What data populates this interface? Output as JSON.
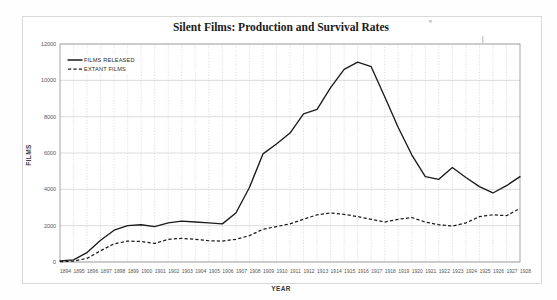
{
  "figure": {
    "title": "Silent Films: Production and Survival Rates"
  },
  "legend": {
    "items": [
      {
        "label": "FILMS RELEASED",
        "style": "solid"
      },
      {
        "label": "EXTANT FILMS",
        "style": "dashed"
      }
    ]
  },
  "axes": {
    "x_title": "YEAR",
    "y_title": "FILMS",
    "y_ticks": [
      "0",
      "2000",
      "4000",
      "6000",
      "8000",
      "10000",
      "12000"
    ],
    "x_ticks": [
      "1894",
      "1895",
      "1896",
      "1897",
      "1898",
      "1899",
      "1900",
      "1901",
      "1902",
      "1903",
      "1904",
      "1905",
      "1906",
      "1907",
      "1908",
      "1909",
      "1910",
      "1911",
      "1912",
      "1913",
      "1914",
      "1915",
      "1916",
      "1917",
      "1918",
      "1919",
      "1920",
      "1921",
      "1922",
      "1923",
      "1924",
      "1925",
      "1926",
      "1927",
      "1928"
    ]
  },
  "chart_data": {
    "type": "line",
    "title": "Silent Films: Production and Survival Rates",
    "xlabel": "YEAR",
    "ylabel": "FILMS",
    "xlim": [
      1894,
      1928
    ],
    "ylim": [
      0,
      12000
    ],
    "grid": true,
    "legend_position": "top-left",
    "x": [
      1894,
      1895,
      1896,
      1897,
      1898,
      1899,
      1900,
      1901,
      1902,
      1903,
      1904,
      1905,
      1906,
      1907,
      1908,
      1909,
      1910,
      1911,
      1912,
      1913,
      1914,
      1915,
      1916,
      1917,
      1918,
      1919,
      1920,
      1921,
      1922,
      1923,
      1924,
      1925,
      1926,
      1927,
      1928
    ],
    "series": [
      {
        "name": "FILMS RELEASED",
        "style": "solid",
        "values": [
          60,
          120,
          520,
          1200,
          1750,
          2000,
          2050,
          1950,
          2150,
          2250,
          2200,
          2150,
          2100,
          2700,
          4100,
          5950,
          6500,
          7100,
          8150,
          8400,
          9600,
          10600,
          11000,
          10750,
          9100,
          7400,
          5900,
          4700,
          4550,
          5200,
          4650,
          4150,
          3800,
          4200,
          4700
        ]
      },
      {
        "name": "EXTANT FILMS",
        "style": "dashed",
        "values": [
          20,
          50,
          200,
          620,
          1000,
          1150,
          1130,
          1020,
          1250,
          1300,
          1250,
          1170,
          1150,
          1250,
          1450,
          1800,
          1950,
          2100,
          2350,
          2600,
          2700,
          2620,
          2500,
          2350,
          2200,
          2350,
          2450,
          2200,
          2050,
          1980,
          2150,
          2500,
          2600,
          2550,
          2950
        ]
      }
    ]
  }
}
